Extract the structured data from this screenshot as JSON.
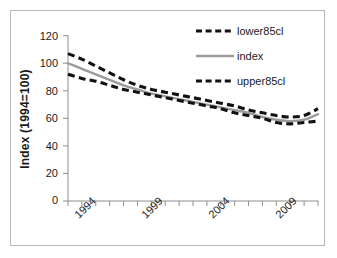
{
  "figure": {
    "frame_color": "#b9b9b9",
    "background": "#ffffff"
  },
  "chart_data": {
    "type": "line",
    "title": "",
    "subtitle": "",
    "xlabel": "",
    "ylabel": "Index (1994=100)",
    "xlim": [
      1993,
      2011
    ],
    "ylim": [
      0,
      120
    ],
    "grid": false,
    "legend_position": "top-right",
    "y_ticks": [
      "0",
      "20",
      "40",
      "60",
      "80",
      "100",
      "120"
    ],
    "y_tick_values": [
      0,
      20,
      40,
      60,
      80,
      100,
      120
    ],
    "x_ticks": [
      "1994",
      "1999",
      "2004",
      "2009"
    ],
    "x_tick_values": [
      1994,
      1999,
      2004,
      2009
    ],
    "x": [
      1993,
      1994,
      1995,
      1996,
      1997,
      1998,
      1999,
      2000,
      2001,
      2002,
      2003,
      2004,
      2005,
      2006,
      2007,
      2008,
      2009,
      2010,
      2011
    ],
    "series": [
      {
        "name": "lower85cl",
        "style": "dashed",
        "color": "#111111",
        "values": [
          107,
          103,
          98,
          93,
          88,
          84,
          81,
          79,
          77,
          75,
          73,
          71,
          69,
          66,
          64,
          62,
          61,
          62,
          67
        ]
      },
      {
        "name": "index",
        "style": "solid",
        "color": "#9a9a9a",
        "values": [
          100,
          96,
          92,
          88,
          84,
          81,
          78,
          76,
          74,
          72,
          70,
          68,
          66,
          64,
          61,
          59,
          58,
          59,
          63
        ]
      },
      {
        "name": "upper85cl",
        "style": "dashed",
        "color": "#111111",
        "values": [
          92,
          89,
          87,
          84,
          81,
          79,
          77,
          75,
          73,
          71,
          69,
          67,
          64,
          62,
          60,
          57,
          56,
          57,
          58
        ]
      }
    ]
  },
  "legend": {
    "items": [
      {
        "label": "lower85cl",
        "style": "dashed",
        "color": "#111111"
      },
      {
        "label": "index",
        "style": "solid",
        "color": "#9a9a9a"
      },
      {
        "label": "upper85cl",
        "style": "dashed",
        "color": "#111111"
      }
    ]
  }
}
